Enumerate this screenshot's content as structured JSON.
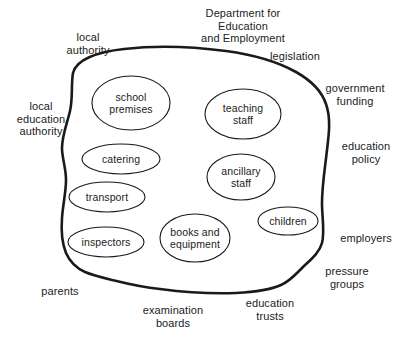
{
  "diagram": {
    "type": "boundary-bubble-diagram",
    "title": "Department for\nEducation\nand Employment",
    "title_position": {
      "x": 243,
      "y": 13
    },
    "boundary": {
      "name": "school-boundary",
      "stroke_color": "#1a1a1a",
      "stroke_width": 2.6,
      "fill_color": "#ffffff"
    },
    "internal_elements": [
      {
        "id": "school-premises",
        "label": "school\npremises",
        "cx": 131,
        "cy": 103,
        "rx": 39,
        "ry": 27
      },
      {
        "id": "teaching-staff",
        "label": "teaching\nstaff",
        "cx": 243,
        "cy": 114,
        "rx": 38,
        "ry": 25
      },
      {
        "id": "catering",
        "label": "catering",
        "cx": 121,
        "cy": 159,
        "rx": 39,
        "ry": 15
      },
      {
        "id": "ancillary-staff",
        "label": "ancillary\nstaff",
        "cx": 241,
        "cy": 177,
        "rx": 34,
        "ry": 23
      },
      {
        "id": "transport",
        "label": "transport",
        "cx": 107,
        "cy": 197,
        "rx": 38,
        "ry": 15
      },
      {
        "id": "children",
        "label": "children",
        "cx": 288,
        "cy": 221,
        "rx": 30,
        "ry": 14
      },
      {
        "id": "inspectors",
        "label": "inspectors",
        "cx": 106,
        "cy": 242,
        "rx": 38,
        "ry": 15
      },
      {
        "id": "books-and-equipment",
        "label": "books and\nequipment",
        "cx": 195,
        "cy": 238,
        "rx": 35,
        "ry": 24
      }
    ],
    "external_elements": [
      {
        "id": "local-authority",
        "label": "local\nauthority",
        "x": 88,
        "y": 43
      },
      {
        "id": "legislation",
        "label": "legislation",
        "x": 295,
        "y": 56
      },
      {
        "id": "government-funding",
        "label": "government\nfunding",
        "x": 355,
        "y": 94
      },
      {
        "id": "local-education-authority",
        "label": "local\neducation\nauthority",
        "x": 41,
        "y": 119
      },
      {
        "id": "education-policy",
        "label": "education\npolicy",
        "x": 366,
        "y": 152
      },
      {
        "id": "employers",
        "label": "employers",
        "x": 366,
        "y": 238
      },
      {
        "id": "pressure-groups",
        "label": "pressure\ngroups",
        "x": 347,
        "y": 277
      },
      {
        "id": "parents",
        "label": "parents",
        "x": 60,
        "y": 291
      },
      {
        "id": "examination-boards",
        "label": "examination\nboards",
        "x": 173,
        "y": 316
      },
      {
        "id": "education-trusts",
        "label": "education\ntrusts",
        "x": 270,
        "y": 309
      }
    ]
  }
}
